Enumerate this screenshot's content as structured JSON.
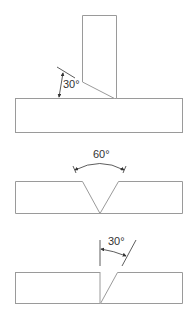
{
  "diagram": {
    "colors": {
      "outline": "#9a9a9a",
      "dimension": "#333333",
      "background": "#ffffff"
    },
    "figures": [
      {
        "id": "t-joint-bevel",
        "type": "T-joint with single bevel",
        "angle_label": "30°"
      },
      {
        "id": "v-groove",
        "type": "Butt joint single V-groove",
        "angle_label": "60°"
      },
      {
        "id": "single-bevel-butt",
        "type": "Butt joint single bevel",
        "angle_label": "30°"
      }
    ]
  }
}
